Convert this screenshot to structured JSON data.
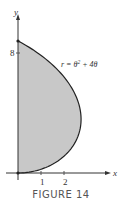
{
  "chart_data": {
    "type": "area",
    "title": "",
    "caption": "FIGURE 14",
    "equation": "r = θ² + 4θ",
    "curve": {
      "kind": "polar",
      "r_of_theta": "theta^2 + 4*theta",
      "theta_range": [
        0,
        1.5708
      ],
      "fill": "#c8c8c8",
      "stroke": "#222222"
    },
    "xlabel": "x",
    "ylabel": "y",
    "x_ticks": [
      1,
      2
    ],
    "y_ticks": [
      8
    ],
    "xlim": [
      -0.55,
      4.0
    ],
    "ylim": [
      -0.5,
      10.5
    ],
    "grid": false,
    "legend": "none",
    "key_points": [
      {
        "theta": 0,
        "x": 0,
        "y": 0
      },
      {
        "theta": 0.9,
        "x": 2.74,
        "y": 3.45
      },
      {
        "theta": 1.5708,
        "x": 0,
        "y": 8.75
      }
    ]
  },
  "labels": {
    "equation_r": "r = θ",
    "equation_sup": "2",
    "equation_rest": " + 4θ",
    "x_axis": "x",
    "y_axis": "y",
    "tick_1": "1",
    "tick_2": "2",
    "tick_8": "8",
    "caption": "FIGURE 14"
  }
}
